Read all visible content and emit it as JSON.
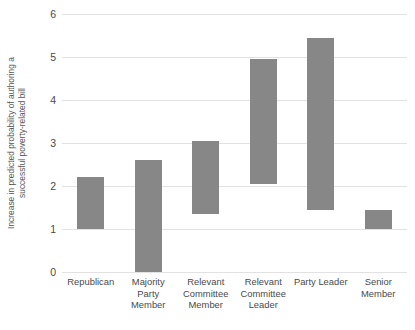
{
  "chart_data": {
    "type": "bar",
    "bar_style": "floating-range",
    "title": "",
    "xlabel": "",
    "ylabel": "Increase in predicted probability of authoring a successful poverty-related bill",
    "ylabel_line1": "Increase in predicted probability of authoring a",
    "ylabel_line2": "successful poverty-related bill",
    "ylim": [
      0,
      6
    ],
    "ytick_values": [
      0,
      1,
      2,
      3,
      4,
      5,
      6
    ],
    "ytick_labels": [
      "0",
      "1",
      "2",
      "3",
      "4",
      "5",
      "6"
    ],
    "grid": true,
    "grid_axis": "y",
    "legend": false,
    "bar_color": "#878787",
    "categories": [
      "Republican",
      "Majority Party Member",
      "Relevant Committee Member",
      "Relevant Committee Leader",
      "Party Leader",
      "Senior Member"
    ],
    "category_label_lines": [
      [
        "Republican"
      ],
      [
        "Majority",
        "Party",
        "Member"
      ],
      [
        "Relevant",
        "Committee",
        "Member"
      ],
      [
        "Relevant",
        "Committee",
        "Leader"
      ],
      [
        "Party Leader"
      ],
      [
        "Senior",
        "Member"
      ]
    ],
    "low": [
      1.0,
      0.0,
      1.35,
      2.05,
      1.45,
      1.0
    ],
    "high": [
      2.2,
      2.6,
      3.05,
      4.95,
      5.45,
      1.45
    ],
    "series": [
      {
        "name": "Predicted probability range",
        "points": [
          {
            "category": "Republican",
            "low": 1.0,
            "high": 2.2
          },
          {
            "category": "Majority Party Member",
            "low": 0.0,
            "high": 2.6
          },
          {
            "category": "Relevant Committee Member",
            "low": 1.35,
            "high": 3.05
          },
          {
            "category": "Relevant Committee Leader",
            "low": 2.05,
            "high": 4.95
          },
          {
            "category": "Party Leader",
            "low": 1.45,
            "high": 5.45
          },
          {
            "category": "Senior Member",
            "low": 1.0,
            "high": 1.45
          }
        ]
      }
    ]
  }
}
